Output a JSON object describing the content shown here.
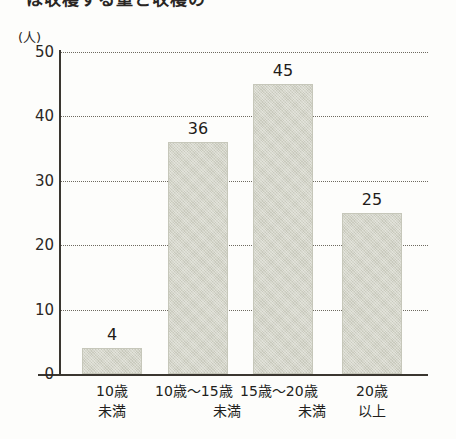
{
  "page": {
    "cropped_heading": "は収穫する量と収穫の",
    "background_color": "#fdfdfb"
  },
  "chart_data": {
    "type": "bar",
    "title": "",
    "subtitle": "",
    "xlabel": "",
    "ylabel": "",
    "unit_label": "(人)",
    "categories": [
      "10歳未満",
      "10歳～15歳未満",
      "15歳～20歳未満",
      "20歳以上"
    ],
    "category_lines": [
      {
        "line1": "10歳",
        "line2": "未満",
        "align": "center"
      },
      {
        "line1": "10歳～15歳",
        "line2": "未満",
        "align": "right"
      },
      {
        "line1": "15歳～20歳",
        "line2": "未満",
        "align": "right"
      },
      {
        "line1": "20歳",
        "line2": "以上",
        "align": "center"
      }
    ],
    "values": [
      4,
      36,
      45,
      25
    ],
    "value_labels": [
      "4",
      "36",
      "45",
      "25"
    ],
    "ylim": [
      0,
      50
    ],
    "ytick_values": [
      0,
      10,
      20,
      30,
      40,
      50
    ],
    "ytick_labels": [
      "0",
      "10",
      "20",
      "30",
      "40",
      "50"
    ],
    "grid": "horizontal-dotted",
    "legend": "none",
    "bar_color": "#d4d5c9",
    "axis_color": "#3a3630",
    "grid_color": "#6e6a60",
    "text_color": "#231f1c"
  }
}
